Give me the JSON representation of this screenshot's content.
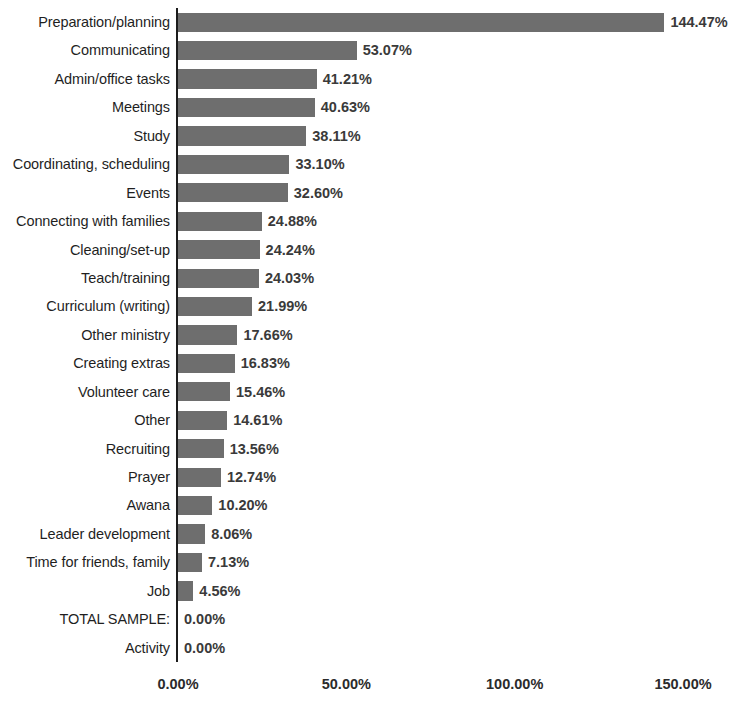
{
  "chart_data": {
    "type": "bar",
    "orientation": "horizontal",
    "title": "",
    "subtitle": "",
    "xlabel": "",
    "ylabel": "",
    "xlim": [
      0,
      150
    ],
    "grid": false,
    "legend": false,
    "value_label_format": "percent-2dp",
    "xticks": [
      "0.00%",
      "50.00%",
      "100.00%",
      "150.00%"
    ],
    "xtick_values": [
      0,
      50,
      100,
      150
    ],
    "categories": [
      "Preparation/planning",
      "Communicating",
      "Admin/office tasks",
      "Meetings",
      "Study",
      "Coordinating, scheduling",
      "Events",
      "Connecting with families",
      "Cleaning/set-up",
      "Teach/training",
      "Curriculum (writing)",
      "Other ministry",
      "Creating extras",
      "Volunteer care",
      "Other",
      "Recruiting",
      "Prayer",
      "Awana",
      "Leader development",
      "Time for friends, family",
      "Job",
      "TOTAL SAMPLE:",
      "Activity"
    ],
    "values": [
      144.47,
      53.07,
      41.21,
      40.63,
      38.11,
      33.1,
      32.6,
      24.88,
      24.24,
      24.03,
      21.99,
      17.66,
      16.83,
      15.46,
      14.61,
      13.56,
      12.74,
      10.2,
      8.06,
      7.13,
      4.56,
      0.0,
      0.0
    ],
    "value_labels": [
      "144.47%",
      "53.07%",
      "41.21%",
      "40.63%",
      "38.11%",
      "33.10%",
      "32.60%",
      "24.88%",
      "24.24%",
      "24.03%",
      "21.99%",
      "17.66%",
      "16.83%",
      "15.46%",
      "14.61%",
      "13.56%",
      "12.74%",
      "10.20%",
      "8.06%",
      "7.13%",
      "4.56%",
      "0.00%",
      "0.00%"
    ],
    "colors": {
      "bar": "#6e6e6e",
      "axis": "#1c1c1c",
      "category_label": "#1f1f1f",
      "value_label": "#3a3a3a",
      "tick_label": "#2b2b2b",
      "background": "#ffffff"
    }
  }
}
